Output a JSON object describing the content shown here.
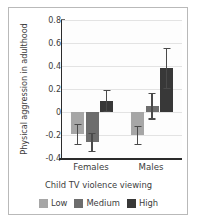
{
  "chart_data": {
    "type": "bar",
    "title": "",
    "subtitle": "",
    "xlabel": "Child TV violence viewing",
    "ylabel": "Physical aggression in adulthood",
    "categories": [
      "Females",
      "Males"
    ],
    "ylim": [
      -0.4,
      0.8
    ],
    "yticks": [
      0.8,
      0.6,
      0.4,
      0.2,
      0,
      -0.2,
      -0.4
    ],
    "ytick_labels": [
      "0.8",
      "0.6",
      "0.4",
      "0.2",
      "0",
      "-0.2",
      "-0.4"
    ],
    "grid": true,
    "legend_position": "bottom",
    "error_bars": "symmetric",
    "series": [
      {
        "name": "Low",
        "color": "#a6a6a6",
        "values": [
          -0.19,
          -0.2
        ],
        "errors": [
          0.09,
          0.08
        ]
      },
      {
        "name": "Medium",
        "color": "#6d6d6d",
        "values": [
          -0.26,
          0.055
        ],
        "errors": [
          0.08,
          0.11
        ]
      },
      {
        "name": "High",
        "color": "#383838",
        "values": [
          0.1,
          0.385
        ],
        "errors": [
          0.09,
          0.175
        ]
      }
    ]
  },
  "legend": {
    "items": [
      {
        "label": "Low",
        "color": "#a6a6a6"
      },
      {
        "label": "Medium",
        "color": "#6d6d6d"
      },
      {
        "label": "High",
        "color": "#383838"
      }
    ]
  },
  "axes": {
    "y_title": "Physical aggression in adulthood",
    "x_title": "Child TV violence viewing"
  }
}
